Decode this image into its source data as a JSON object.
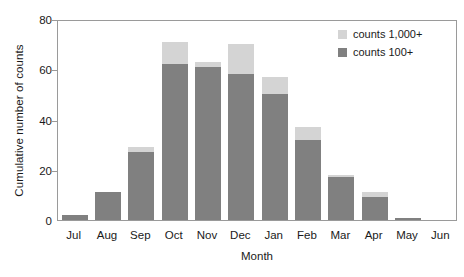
{
  "chart_data": {
    "type": "bar",
    "barmode": "stacked",
    "title": "",
    "xlabel": "Month",
    "ylabel": "Cumulative number of counts",
    "categories": [
      "Jul",
      "Aug",
      "Sep",
      "Oct",
      "Nov",
      "Dec",
      "Jan",
      "Feb",
      "Mar",
      "Apr",
      "May",
      "Jun"
    ],
    "series": [
      {
        "name": "counts 100+",
        "color": "#808080",
        "values": [
          2,
          11,
          27,
          62,
          61,
          58,
          50,
          32,
          17,
          9,
          1,
          0
        ]
      },
      {
        "name": "counts 1,000+",
        "color": "#d4d4d4",
        "values": [
          0,
          0,
          2,
          9,
          2,
          12,
          7,
          5,
          1,
          2,
          0,
          0
        ]
      }
    ],
    "totals": [
      2,
      11,
      29,
      71,
      63,
      70,
      57,
      37,
      18,
      11,
      1,
      0
    ],
    "ylim": [
      0,
      80
    ],
    "yticks": [
      0,
      20,
      40,
      60,
      80
    ],
    "ytick_labels": [
      "0",
      "20",
      "40",
      "60",
      "80"
    ],
    "grid": false,
    "legend_position": "top-right",
    "legend_order": [
      "counts 1,000+",
      "counts 100+"
    ]
  },
  "axes": {
    "y_title": "Cumulative number of counts",
    "x_title": "Month"
  },
  "legend": {
    "entries": [
      {
        "label": "counts 1,000+",
        "color": "#d4d4d4"
      },
      {
        "label": "counts 100+",
        "color": "#808080"
      }
    ]
  },
  "colors": {
    "frame": "#9a9a9a",
    "text": "#1a1a1a",
    "background": "#ffffff",
    "counts_100_plus": "#808080",
    "counts_1000_plus": "#d4d4d4"
  }
}
